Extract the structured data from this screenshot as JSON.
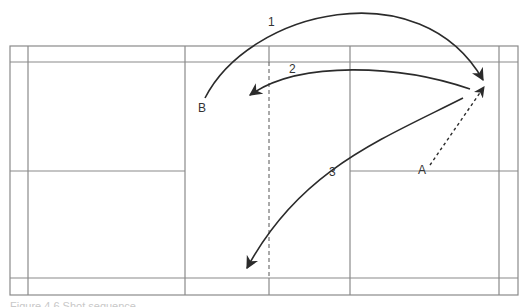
{
  "diagram": {
    "colors": {
      "court_lines": "#8a8a8a",
      "shots": "#2b2b2b",
      "labels": "#333333"
    },
    "positions": [
      {
        "id": "A",
        "label": "A"
      },
      {
        "id": "B",
        "label": "B"
      }
    ],
    "shots": [
      {
        "id": "1",
        "label": "1",
        "style": "solid",
        "description": "High arc from B to rear right corner"
      },
      {
        "id": "2",
        "label": "2",
        "style": "solid",
        "description": "Return arc from rear right to front left"
      },
      {
        "id": "3",
        "label": "3",
        "style": "solid",
        "description": "Diagonal from rear right to rear left"
      },
      {
        "id": "A-move",
        "label": "",
        "style": "dotted",
        "description": "Player movement from A to rear right corner"
      }
    ],
    "caption": "Figure 4.6 Shot sequence"
  }
}
